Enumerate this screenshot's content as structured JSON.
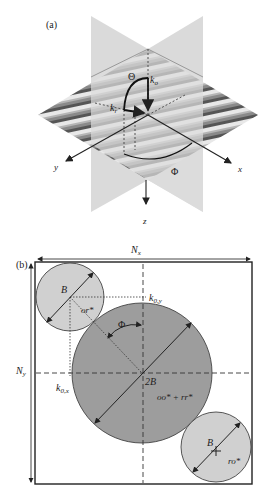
{
  "panel_a": {
    "label": "(a)",
    "axes": {
      "x": "x",
      "y": "y",
      "z": "z"
    },
    "vectors": {
      "k_o": "k",
      "k_o_sub": "o",
      "k_r": "k",
      "k_r_sub": "r"
    },
    "angles": {
      "theta": "Θ",
      "phi": "Φ"
    }
  },
  "panel_b": {
    "label": "(b)",
    "dims": {
      "nx": "N",
      "nx_sub": "x",
      "ny": "N",
      "ny_sub": "y"
    },
    "k0y": "k",
    "k0y_sub": "0,y",
    "k0x": "k",
    "k0x_sub": "0,x",
    "phi": "Φ",
    "top_left_circle": {
      "radius_label": "B",
      "term": "or*"
    },
    "center_circle": {
      "radius_label": "2B",
      "term": "oo* + rr*"
    },
    "bottom_right_circle": {
      "radius_label": "B",
      "term": "ro*"
    }
  },
  "colors": {
    "plane": "#d4d4d4",
    "big_circle": "#9a9a9a",
    "small_circle": "#cfcfcf",
    "line": "#222222"
  }
}
